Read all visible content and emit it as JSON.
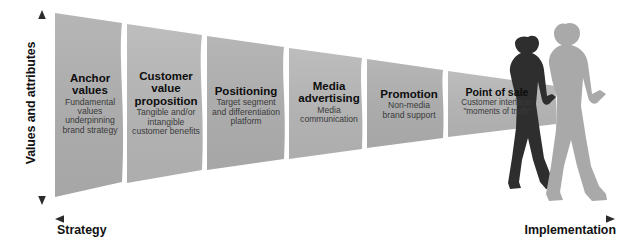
{
  "diagram": {
    "axes": {
      "vertical_label": "Values and attributes",
      "horizontal_left_label": "Strategy",
      "horizontal_right_label": "Implementation"
    },
    "colors": {
      "segment_fill": "#acacac",
      "segment_fill_light": "#b4b4b4",
      "separator": "#ffffff",
      "axis": "#231f20",
      "title_text": "#0d0d0d",
      "body_text": "#3a3a3a",
      "silhouette_dark": "#2b2b2b",
      "silhouette_light": "#a9a9a9"
    },
    "segments": [
      {
        "id": "anchor-values",
        "title": "Anchor values",
        "title_lines": [
          "Anchor",
          "values"
        ],
        "subtitle": "Fundamental values underpinning brand strategy",
        "subtitle_lines": [
          "Fundamental",
          "values",
          "underpinning",
          "brand strategy"
        ]
      },
      {
        "id": "customer-value-proposition",
        "title": "Customer value proposition",
        "title_lines": [
          "Customer",
          "value",
          "proposition"
        ],
        "subtitle": "Tangible and/or intangible customer benefits",
        "subtitle_lines": [
          "Tangible and/or",
          "intangible",
          "customer benefits"
        ]
      },
      {
        "id": "positioning",
        "title": "Positioning",
        "title_lines": [
          "Positioning"
        ],
        "subtitle": "Target segment and differentiation platform",
        "subtitle_lines": [
          "Target segment",
          "and differentiation",
          "platform"
        ]
      },
      {
        "id": "media-advertising",
        "title": "Media advertising",
        "title_lines": [
          "Media",
          "advertising"
        ],
        "subtitle": "Media communication",
        "subtitle_lines": [
          "Media",
          "communication"
        ]
      },
      {
        "id": "promotion",
        "title": "Promotion",
        "title_lines": [
          "Promotion"
        ],
        "subtitle": "Non-media brand support",
        "subtitle_lines": [
          "Non-media",
          "brand support"
        ]
      },
      {
        "id": "point-of-sale",
        "title": "Point of sale",
        "title_lines": [
          "Point of sale"
        ],
        "subtitle": "Customer interface: \"moments of truth\"",
        "subtitle_lines": [
          "Customer interface:",
          "\"moments of truth\""
        ]
      }
    ],
    "figures": [
      {
        "id": "walking-woman-silhouette",
        "name": "walking-woman-silhouette"
      },
      {
        "id": "walking-man-silhouette",
        "name": "walking-man-silhouette"
      }
    ]
  }
}
